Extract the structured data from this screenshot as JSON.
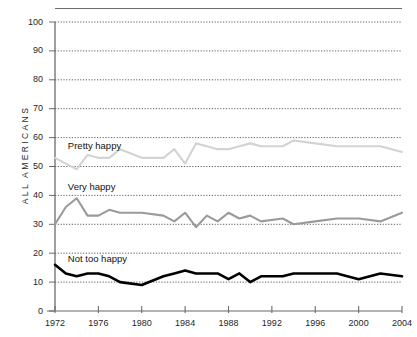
{
  "chart_data": {
    "type": "line",
    "title": "",
    "subtitle": "",
    "xlabel": "",
    "ylabel": "ALL AMERICANS",
    "ylim": [
      0,
      100
    ],
    "xlim": [
      1972,
      2004
    ],
    "grid": true,
    "grid_style": "dotted-horizontal",
    "legend_position": "inline-labels",
    "yticks": [
      0,
      10,
      20,
      30,
      40,
      50,
      60,
      70,
      80,
      90,
      100
    ],
    "ytick_labels": [
      "0",
      "10",
      "20",
      "30",
      "40",
      "50",
      "60",
      "70",
      "80",
      "90",
      "100"
    ],
    "xticks": [
      1972,
      1976,
      1980,
      1984,
      1988,
      1992,
      1996,
      2000,
      2004
    ],
    "xtick_labels": [
      "1972",
      "1976",
      "1980",
      "1984",
      "1988",
      "1992",
      "1996",
      "2000",
      "2004"
    ],
    "x": [
      1972,
      1973,
      1974,
      1975,
      1976,
      1977,
      1978,
      1980,
      1982,
      1983,
      1984,
      1985,
      1986,
      1987,
      1988,
      1989,
      1990,
      1991,
      1993,
      1994,
      1996,
      1998,
      2000,
      2002,
      2004
    ],
    "series": [
      {
        "name": "Pretty happy",
        "color": "#d3d3d3",
        "label_x": 1973,
        "label_y": 57,
        "values": [
          53,
          51,
          49,
          54,
          53,
          53,
          56,
          53,
          53,
          56,
          51,
          58,
          57,
          56,
          56,
          57,
          58,
          57,
          57,
          59,
          58,
          57,
          57,
          57,
          55
        ]
      },
      {
        "name": "Very happy",
        "color": "#9a9a9a",
        "label_x": 1973,
        "label_y": 43,
        "values": [
          30,
          36,
          39,
          33,
          33,
          35,
          34,
          34,
          33,
          31,
          34,
          29,
          33,
          31,
          34,
          32,
          33,
          31,
          32,
          30,
          31,
          32,
          32,
          31,
          34
        ]
      },
      {
        "name": "Not too happy",
        "color": "#000000",
        "label_x": 1973,
        "label_y": 18,
        "values": [
          16,
          13,
          12,
          13,
          13,
          12,
          10,
          9,
          12,
          13,
          14,
          13,
          13,
          13,
          11,
          13,
          10,
          12,
          12,
          13,
          13,
          13,
          11,
          13,
          12
        ]
      }
    ]
  },
  "axis": {
    "y_title": "ALL AMERICANS"
  }
}
